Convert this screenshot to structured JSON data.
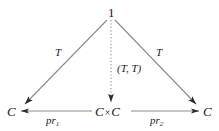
{
  "diagram": {
    "background_color": "#ffffff",
    "line_color": "#8c8c8c",
    "arrowhead_color": "#2b2b2b",
    "text_color": "#1a1a1a",
    "nodes": {
      "apex": "1",
      "left": "C",
      "right": "C",
      "bottom_center_left": "C",
      "bottom_center_times": "×",
      "bottom_center_right": "C"
    },
    "edges": {
      "left_diagonal_label": "T",
      "right_diagonal_label": "T",
      "vertical_label": "(T, T)",
      "bottom_left_label_base": "pr",
      "bottom_left_label_sub": "1",
      "bottom_right_label_base": "pr",
      "bottom_right_label_sub": "2"
    }
  }
}
